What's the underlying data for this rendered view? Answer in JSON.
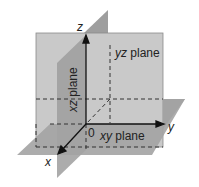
{
  "diagram": {
    "axes": {
      "x": "x",
      "y": "y",
      "z": "z",
      "origin": "0"
    },
    "planes": {
      "xy": {
        "var": "xy",
        "word": "plane"
      },
      "yz": {
        "var": "yz",
        "word": "plane"
      },
      "xz": {
        "var": "xz",
        "word": "plane"
      }
    },
    "colors": {
      "yz_plane": "#c9c9c9",
      "xz_plane": "#9e9e9e",
      "xy_plane": "#a3a3a3",
      "axis": "#111111",
      "dashed": "#333333"
    }
  }
}
